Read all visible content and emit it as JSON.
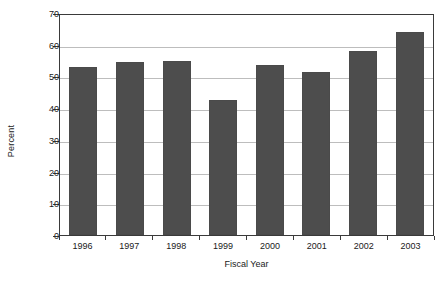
{
  "chart_data": {
    "type": "bar",
    "title": "",
    "subtitle": "",
    "xlabel": "Fiscal Year",
    "ylabel": "Percent",
    "categories": [
      "1996",
      "1997",
      "1998",
      "1999",
      "2000",
      "2001",
      "2002",
      "2003"
    ],
    "values": [
      53,
      54.5,
      55,
      42.5,
      53.5,
      51.5,
      58,
      64
    ],
    "series": [
      {
        "name": "Percent",
        "values": [
          53,
          54.5,
          55,
          42.5,
          53.5,
          51.5,
          58,
          64
        ]
      }
    ],
    "ylim": [
      0,
      70
    ],
    "xlim": [
      0,
      8
    ],
    "y_ticks": [
      0,
      10,
      20,
      30,
      40,
      50,
      60,
      70
    ],
    "y_tick_labels": [
      "0",
      "10",
      "20",
      "30",
      "40",
      "50",
      "60",
      "70"
    ],
    "grid": "horizontal",
    "legend": "none",
    "legend_position": "none",
    "bar_color": "#4d4d4d",
    "gridline_color": "#bdbdbd",
    "axis_color": "#3a3a3a",
    "background_color": "#ffffff"
  }
}
